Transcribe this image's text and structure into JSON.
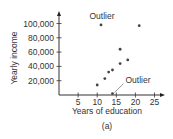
{
  "chart_data": {
    "type": "scatter",
    "title": "",
    "caption": "(a)",
    "xlabel": "Years of education",
    "ylabel": "Yearly income",
    "xlim": [
      0,
      27
    ],
    "ylim": [
      0,
      110000
    ],
    "x_ticks": [
      5,
      10,
      15,
      20,
      25
    ],
    "x_tick_labels": [
      "5",
      "10",
      "15",
      "20",
      "25"
    ],
    "y_ticks": [
      20000,
      40000,
      60000,
      80000,
      100000
    ],
    "y_tick_labels": [
      "20,000",
      "40,000",
      "60,000",
      "80,000",
      "100,000"
    ],
    "grid": false,
    "legend": null,
    "points": [
      {
        "x": 10,
        "y": 14000
      },
      {
        "x": 12,
        "y": 23000
      },
      {
        "x": 13,
        "y": 32000
      },
      {
        "x": 14,
        "y": 35000
      },
      {
        "x": 16,
        "y": 44000
      },
      {
        "x": 16,
        "y": 64000
      },
      {
        "x": 18,
        "y": 49000
      },
      {
        "x": 11,
        "y": 98000
      },
      {
        "x": 21,
        "y": 97000
      },
      {
        "x": 14,
        "y": 2000
      }
    ],
    "annotations": [
      {
        "text": "Outlier",
        "target": {
          "x": 11,
          "y": 98000
        }
      },
      {
        "text": "Outlier",
        "target": {
          "x": 14,
          "y": 2000
        }
      }
    ]
  }
}
